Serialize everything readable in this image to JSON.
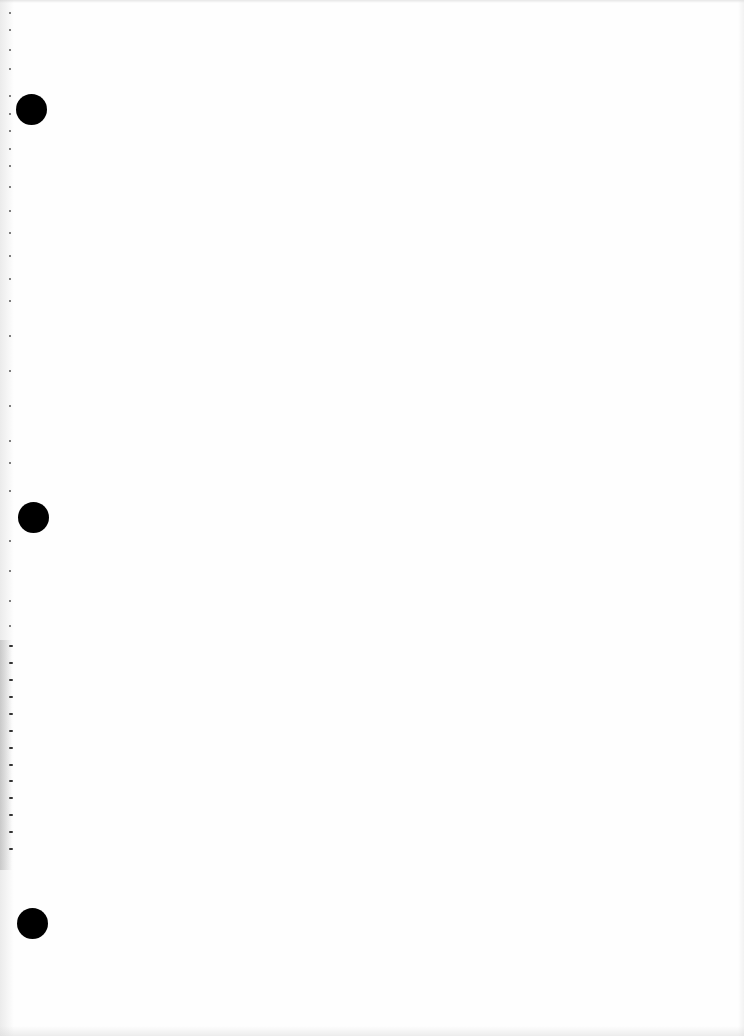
{
  "document": {
    "type": "blank-scanned-page",
    "background_color": "#fefefe",
    "text_content": ""
  },
  "punch_holes": [
    {
      "center_x": 31,
      "center_y": 109,
      "diameter": 31,
      "color": "#000000"
    },
    {
      "center_x": 33,
      "center_y": 517,
      "diameter": 31,
      "color": "#000000"
    },
    {
      "center_x": 32,
      "center_y": 923,
      "diameter": 31,
      "color": "#000000"
    }
  ],
  "perforation_marks_y": [
    12,
    29,
    49,
    68,
    95,
    113,
    130,
    148,
    165,
    186,
    210,
    232,
    255,
    278,
    300,
    335,
    370,
    405,
    440,
    462,
    490,
    540,
    570,
    600,
    625,
    645,
    662,
    679,
    696,
    713,
    730,
    747,
    764,
    780,
    797,
    814,
    831,
    848
  ]
}
